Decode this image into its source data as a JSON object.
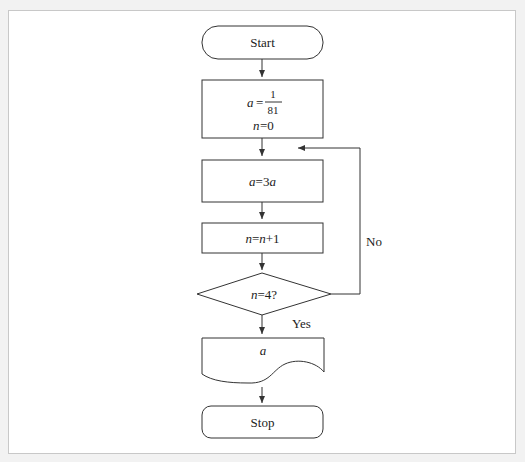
{
  "flowchart": {
    "start": {
      "label": "Start"
    },
    "init": {
      "line1_var": "a",
      "line1_eq": "=",
      "frac_num": "1",
      "frac_den": "81",
      "line2_var": "n",
      "line2_rest": "=0"
    },
    "step1": {
      "var": "a",
      "rest": "=3",
      "var2": "a"
    },
    "step2": {
      "var": "n",
      "eq": "=",
      "var2": "n",
      "rest": "+1"
    },
    "decision": {
      "var": "n",
      "rest": "=4?"
    },
    "no_label": "No",
    "yes_label": "Yes",
    "output": {
      "var": "a"
    },
    "stop": {
      "label": "Stop"
    }
  },
  "colors": {
    "stroke": "#333333",
    "background": "#ffffff",
    "page": "#f2f2f2"
  }
}
